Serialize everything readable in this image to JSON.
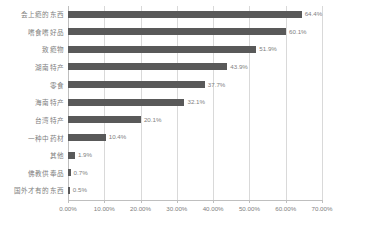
{
  "chart_data": {
    "type": "bar",
    "orientation": "horizontal",
    "title": "",
    "xlabel": "",
    "ylabel": "",
    "xlim": [
      0,
      70
    ],
    "grid": true,
    "legend": false,
    "bar_color": "#595959",
    "gridline_color": "#d9d9d9",
    "label_color": "#808080",
    "categories": [
      "会上瘾的东西",
      "嗜食嗜好品",
      "致瘾物",
      "湖南特产",
      "零食",
      "海南特产",
      "台湾特产",
      "一种中药材",
      "其他",
      "佛教供奉品",
      "国外才有的东西"
    ],
    "values": [
      64.4,
      60.1,
      51.9,
      43.9,
      37.7,
      32.1,
      20.1,
      10.4,
      1.9,
      0.7,
      0.5
    ],
    "value_labels": [
      "64.4%",
      "60.1%",
      "51.9%",
      "43.9%",
      "37.7%",
      "32.1%",
      "20.1%",
      "10.4%",
      "1.9%",
      "0.7%",
      "0.5%"
    ],
    "xticks": [
      0,
      10,
      20,
      30,
      40,
      50,
      60,
      70
    ],
    "xtick_labels": [
      "0.00%",
      "10.00%",
      "20.00%",
      "30.00%",
      "40.00%",
      "50.00%",
      "60.00%",
      "70.00%"
    ]
  }
}
